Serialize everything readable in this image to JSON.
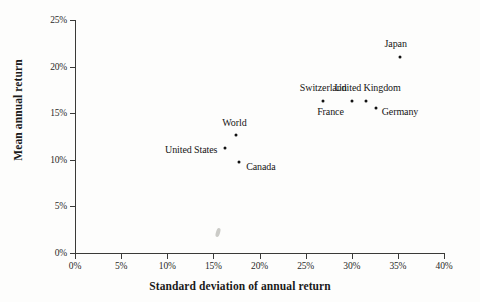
{
  "chart_data": {
    "type": "scatter",
    "title": "",
    "xlabel": "Standard deviation of annual return",
    "ylabel": "Mean annual return",
    "xlim": [
      0,
      40
    ],
    "ylim": [
      0,
      25
    ],
    "grid": false,
    "legend": null,
    "x_ticks": [
      "0%",
      "5%",
      "10%",
      "15%",
      "20%",
      "25%",
      "30%",
      "35%",
      "40%"
    ],
    "x_tick_values": [
      0,
      5,
      10,
      15,
      20,
      25,
      30,
      35,
      40
    ],
    "y_ticks": [
      "0%",
      "5%",
      "10%",
      "15%",
      "20%",
      "25%"
    ],
    "y_tick_values": [
      0,
      5,
      10,
      15,
      20,
      25
    ],
    "points": [
      {
        "label": "Japan",
        "x": 35.2,
        "y": 21.0,
        "label_dx": -4,
        "label_dy": -14,
        "label_anchor": "middle"
      },
      {
        "label": "United Kingdom",
        "x": 31.5,
        "y": 16.3,
        "label_dx": 2,
        "label_dy": -14,
        "label_anchor": "middle"
      },
      {
        "label": "Switzerland",
        "x": 26.9,
        "y": 16.3,
        "label_dx": 0,
        "label_dy": -14,
        "label_anchor": "middle"
      },
      {
        "label": "France",
        "x": 30.0,
        "y": 16.3,
        "label_dx": -8,
        "label_dy": 10,
        "label_anchor": "end"
      },
      {
        "label": "Germany",
        "x": 32.6,
        "y": 15.6,
        "label_dx": 6,
        "label_dy": 3,
        "label_anchor": "start"
      },
      {
        "label": "World",
        "x": 17.5,
        "y": 12.7,
        "label_dx": -2,
        "label_dy": -13,
        "label_anchor": "middle"
      },
      {
        "label": "United States",
        "x": 16.3,
        "y": 11.3,
        "label_dx": -8,
        "label_dy": 1,
        "label_anchor": "end"
      },
      {
        "label": "Canada",
        "x": 17.8,
        "y": 9.8,
        "label_dx": 7,
        "label_dy": 4,
        "label_anchor": "start"
      }
    ],
    "artifacts": [
      {
        "name": "scan-smudge",
        "x": 16.0,
        "y": 2.2
      }
    ]
  }
}
